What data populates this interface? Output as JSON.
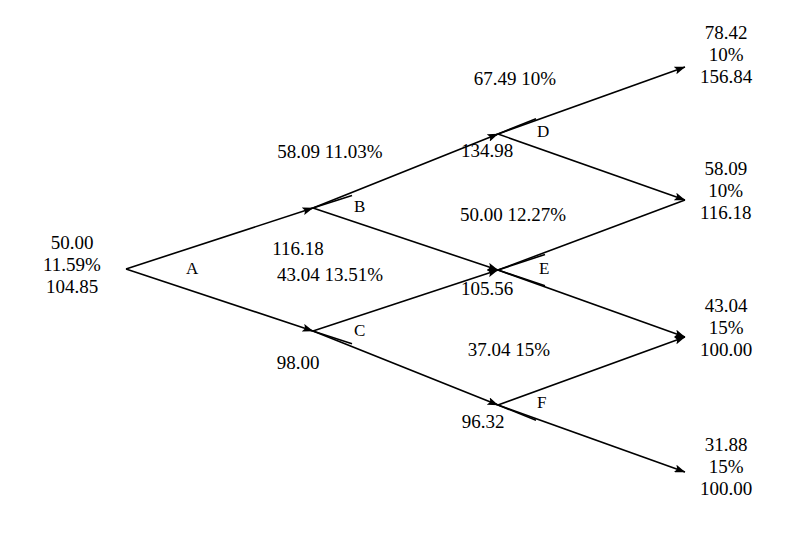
{
  "diagram": {
    "type": "recombining-binomial-lattice",
    "title": "",
    "root": {
      "id": "root",
      "price": "50.00",
      "rate": "11.59%",
      "value": "104.85",
      "branch_label": "A"
    },
    "nodes": [
      {
        "id": "B",
        "label": "B",
        "price": "58.09",
        "rate": "11.03%",
        "value": "116.18"
      },
      {
        "id": "C",
        "label": "C",
        "price": "43.04",
        "rate": "13.51%",
        "value": "98.00"
      },
      {
        "id": "D",
        "label": "D",
        "price": "67.49",
        "rate": "10%",
        "value": "134.98"
      },
      {
        "id": "E",
        "label": "E",
        "price": "50.00",
        "rate": "12.27%",
        "value": "105.56"
      },
      {
        "id": "F",
        "label": "F",
        "price": "37.04",
        "rate": "15%",
        "value": "96.32"
      }
    ],
    "terminals": [
      {
        "id": "T1",
        "price": "78.42",
        "rate": "10%",
        "value": "156.84"
      },
      {
        "id": "T2",
        "price": "58.09",
        "rate": "10%",
        "value": "116.18"
      },
      {
        "id": "T3",
        "price": "43.04",
        "rate": "15%",
        "value": "100.00"
      },
      {
        "id": "T4",
        "price": "31.88",
        "rate": "15%",
        "value": "100.00"
      }
    ],
    "colors": {
      "stroke": "#000000",
      "background": "#ffffff",
      "text": "#000000"
    }
  }
}
